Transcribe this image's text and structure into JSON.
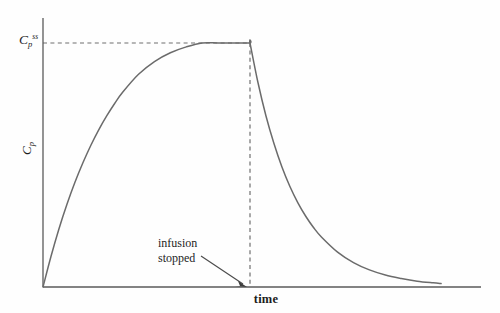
{
  "figure": {
    "background_color": "#fefefe",
    "curve_color": "#6b6b6b",
    "axis_color": "#5a5a5a",
    "dash_color": "#6f6f6f",
    "text_color": "#1d1d1d"
  },
  "labels": {
    "y_axis_title_main": "C",
    "y_axis_title_sub": "p",
    "steady_state_main": "C",
    "steady_state_sub": "p",
    "steady_state_sup": "ss",
    "x_axis_title": "time",
    "annotation_line1": "infusion",
    "annotation_line2": "stopped"
  },
  "chart_data": {
    "type": "line",
    "title": "",
    "subtitle": "",
    "xlabel": "time",
    "ylabel": "Cp",
    "grid": false,
    "legend": null,
    "xlim": [
      0,
      100
    ],
    "ylim": [
      0,
      1.15
    ],
    "annotations": [
      {
        "text": "infusion stopped",
        "x": 33,
        "y": 0.22,
        "arrow_to_x": 52,
        "arrow_to_y": 0.0
      },
      {
        "text": "Cp ss",
        "type": "y-reference-line",
        "y": 1.0
      }
    ],
    "reference_lines": [
      {
        "orientation": "horizontal",
        "value": 1.0,
        "style": "dashed",
        "from_x": 0,
        "to_x": 52
      },
      {
        "orientation": "vertical",
        "value": 52,
        "style": "dashed",
        "from_y": 0,
        "to_y": 1.0
      }
    ],
    "series": [
      {
        "name": "plasma concentration",
        "phase_1": "infusion (exponential approach to steady state)",
        "phase_2": "post-infusion (exponential decay)",
        "infusion_stop_x": 52,
        "steady_state_value": 1.0,
        "x": [
          0,
          2,
          4,
          6,
          8,
          10,
          12,
          14,
          16,
          18,
          20,
          24,
          28,
          32,
          36,
          40,
          44,
          48,
          52,
          52,
          54,
          56,
          58,
          60,
          62,
          64,
          66,
          68,
          70,
          74,
          78,
          82,
          86,
          90,
          94,
          98,
          100
        ],
        "y": [
          0.0,
          0.125,
          0.238,
          0.338,
          0.428,
          0.508,
          0.58,
          0.644,
          0.701,
          0.752,
          0.798,
          0.872,
          0.924,
          0.96,
          0.984,
          1.0,
          1.0,
          1.0,
          1.0,
          1.0,
          0.838,
          0.702,
          0.589,
          0.493,
          0.413,
          0.346,
          0.29,
          0.243,
          0.204,
          0.143,
          0.1,
          0.07,
          0.049,
          0.035,
          0.024,
          0.017,
          0.014
        ]
      }
    ]
  },
  "geometry": {
    "origin_x": 43,
    "origin_y": 287,
    "y_axis_top": 18,
    "x_axis_right": 481,
    "plateau_y": 43,
    "stop_x": 250
  }
}
